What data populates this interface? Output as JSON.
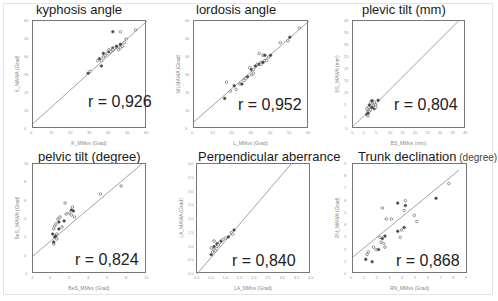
{
  "figure": {
    "panels": [
      {
        "title": "kyphosis angle",
        "title_suffix": "",
        "r_label": "r = 0,926",
        "xlabel": "K_MMvs (Grad)",
        "ylabel": "K_MAWA (Grad)",
        "xticks": [
          "0",
          "10",
          "20",
          "30",
          "40",
          "50",
          "60"
        ],
        "yticks": [
          "0",
          "10",
          "20",
          "30",
          "40",
          "50",
          "60"
        ]
      },
      {
        "title": "lordosis angle",
        "title_suffix": "",
        "r_label": "r = 0,952",
        "xlabel": "L_MMvs (Grad)",
        "ylabel": "WLMAWA (Grad)",
        "xticks": [
          "0",
          "10",
          "20",
          "30",
          "40",
          "50",
          "60"
        ],
        "yticks": [
          "0",
          "10",
          "20",
          "30",
          "40",
          "50",
          "60"
        ]
      },
      {
        "title": "plevic tilt (mm)",
        "title_suffix": "",
        "r_label": "r = 0,804",
        "xlabel": "BS_MMvs (mm)",
        "ylabel": "BS_MAWA (mm)",
        "xticks": [
          "-5",
          "0",
          "5",
          "10",
          "15",
          "20",
          "25",
          "30",
          "35",
          "40"
        ],
        "yticks": [
          "-5",
          "0",
          "5",
          "10",
          "15",
          "20",
          "25",
          "30",
          "35",
          "40"
        ]
      },
      {
        "title": "pelvic tilt (degree)",
        "title_suffix": "",
        "r_label": "r = 0,824",
        "xlabel": "BeS_MMvs (Grad)",
        "ylabel": "BeS_MAWA (Grad)",
        "xticks": [
          "-1",
          "0",
          "2",
          "4",
          "6",
          "8",
          "10"
        ],
        "yticks": [
          "-1",
          "0",
          "2",
          "4",
          "6",
          "8",
          "10"
        ]
      },
      {
        "title": "Perpendicular aberrance",
        "title_suffix": "",
        "r_label": "r = 0,840",
        "xlabel": "LA_MMvs (Grad)",
        "ylabel": "LA_MAWA (Grad)",
        "xticks": [
          "0,0",
          "0,5",
          "1,0",
          "1,5",
          "2,0",
          "2,5",
          "3,0",
          "3,5",
          "4,0"
        ],
        "yticks": [
          "0,0",
          "0,5",
          "1,0",
          "1,5",
          "2,0",
          "2,5",
          "3,0",
          "3,5",
          "4,0"
        ]
      },
      {
        "title": "Trunk declination",
        "title_suffix": "(degree)",
        "r_label": "r = 0,868",
        "xlabel": "RN_MMvs (Grad)",
        "ylabel": "RN_MAWA (Grad)",
        "xticks": [
          "0",
          "1",
          "2",
          "3",
          "4",
          "5",
          "6",
          "7",
          "8",
          "9"
        ],
        "yticks": [
          "0",
          "1",
          "2",
          "3",
          "4",
          "5",
          "6",
          "7",
          "8",
          "9"
        ]
      }
    ]
  },
  "chart_data": [
    {
      "type": "scatter",
      "title": "kyphosis angle",
      "xlabel": "K_MMvs (Grad)",
      "ylabel": "K_MAWA (Grad)",
      "xlim": [
        0,
        60
      ],
      "ylim": [
        0,
        60
      ],
      "grid": false,
      "annotation": "r = 0,926",
      "regression_line": {
        "x": [
          0,
          60
        ],
        "y": [
          3,
          60
        ]
      },
      "x": [
        29,
        30,
        34,
        35,
        36,
        37,
        37,
        38,
        39,
        40,
        40,
        41,
        42,
        42,
        43,
        44,
        45,
        46,
        46,
        47,
        48,
        42,
        46,
        54,
        36,
        49
      ],
      "y": [
        31,
        32,
        38,
        39,
        38,
        40,
        42,
        41,
        42,
        43,
        44,
        43,
        45,
        44,
        45,
        46,
        44,
        45,
        47,
        46,
        48,
        54,
        54,
        55,
        35,
        50
      ]
    },
    {
      "type": "scatter",
      "title": "lordosis angle",
      "xlabel": "L_MMvs (Grad)",
      "ylabel": "WLMAWA (Grad)",
      "xlim": [
        0,
        60
      ],
      "ylim": [
        0,
        60
      ],
      "grid": false,
      "annotation": "r = 0,952",
      "regression_line": {
        "x": [
          0,
          60
        ],
        "y": [
          4,
          60
        ]
      },
      "x": [
        16,
        17,
        19,
        21,
        22,
        24,
        25,
        26,
        27,
        28,
        29,
        30,
        30,
        31,
        31,
        32,
        33,
        34,
        34,
        35,
        35,
        36,
        36,
        37,
        37,
        38,
        39,
        40,
        45,
        49,
        50,
        55
      ],
      "y": [
        17,
        26,
        21,
        24,
        22,
        25,
        25,
        27,
        28,
        29,
        34,
        30,
        33,
        31,
        33,
        35,
        36,
        42,
        36,
        37,
        36,
        37,
        41,
        38,
        41,
        38,
        40,
        41,
        48,
        49,
        51,
        56
      ]
    },
    {
      "type": "scatter",
      "title": "plevic tilt (mm)",
      "xlabel": "BS_MMvs (mm)",
      "ylabel": "BS_MAWA (mm)",
      "xlim": [
        -5,
        40
      ],
      "ylim": [
        -5,
        40
      ],
      "grid": false,
      "annotation": "r = 0,804",
      "regression_line": {
        "x": [
          -5,
          37
        ],
        "y": [
          -4,
          40
        ]
      },
      "x": [
        0.5,
        0.8,
        1,
        1,
        1.2,
        1.5,
        1.5,
        2,
        2,
        2.5,
        3,
        3,
        3.5,
        4,
        4,
        5,
        1,
        0.5,
        2.5,
        3.5
      ],
      "y": [
        1,
        2,
        3,
        1.5,
        4,
        2.5,
        5,
        3,
        6,
        4,
        5,
        6.5,
        3.5,
        5,
        4,
        7,
        0.5,
        3.5,
        6.8,
        6.2
      ]
    },
    {
      "type": "scatter",
      "title": "pelvic tilt (degree)",
      "xlabel": "BeS_MMvs (Grad)",
      "ylabel": "BeS_MAWA (Grad)",
      "xlim": [
        -1,
        10
      ],
      "ylim": [
        -1,
        10
      ],
      "grid": false,
      "annotation": "r = 0,824",
      "regression_line": {
        "x": [
          -1,
          9.5
        ],
        "y": [
          0.8,
          10
        ]
      },
      "x": [
        0.9,
        1.0,
        1.0,
        1.1,
        1.1,
        1.2,
        1.2,
        1.3,
        1.4,
        1.5,
        1.6,
        1.8,
        2.0,
        2.2,
        2.5,
        2.7,
        2.7,
        2.8,
        2.9,
        3.0,
        1.3,
        1.0,
        5.5,
        7.5,
        1.5,
        2.1
      ],
      "y": [
        3.0,
        2.0,
        3.5,
        2.7,
        3.8,
        4.0,
        2.8,
        3.0,
        4.5,
        3.5,
        4.7,
        3.7,
        4.3,
        5.0,
        5.1,
        5.4,
        4.9,
        5.7,
        5.3,
        4.7,
        2.5,
        2.2,
        7.0,
        7.8,
        4.2,
        6.1
      ]
    },
    {
      "type": "scatter",
      "title": "Perpendicular aberrance",
      "xlabel": "LA_MMvs (Grad)",
      "ylabel": "LA_MAWA (Grad)",
      "xlim": [
        0,
        4
      ],
      "ylim": [
        0,
        4
      ],
      "grid": false,
      "annotation": "r = 0,840",
      "regression_line": {
        "x": [
          0,
          3.3
        ],
        "y": [
          0,
          4
        ]
      },
      "x": [
        0.5,
        0.55,
        0.6,
        0.6,
        0.65,
        0.7,
        0.7,
        0.75,
        0.8,
        0.85,
        0.9,
        1.0,
        1.1,
        1.2,
        1.25,
        1.3,
        0.6,
        0.5
      ],
      "y": [
        0.7,
        0.8,
        0.9,
        1.0,
        0.85,
        1.0,
        1.1,
        1.05,
        1.15,
        1.2,
        1.25,
        1.3,
        1.35,
        1.5,
        1.45,
        1.6,
        1.2,
        0.95
      ]
    },
    {
      "type": "scatter",
      "title": "Trunk declination (degree)",
      "xlabel": "RN_MMvs (Grad)",
      "ylabel": "RN_MAWA (Grad)",
      "xlim": [
        0,
        9
      ],
      "ylim": [
        0,
        9
      ],
      "grid": false,
      "annotation": "r = 0,868",
      "regression_line": {
        "x": [
          0,
          8.3
        ],
        "y": [
          1.4,
          8.5
        ]
      },
      "x": [
        1.0,
        1.1,
        1.2,
        1.5,
        1.6,
        1.8,
        2.0,
        2.1,
        2.2,
        2.3,
        2.4,
        2.5,
        2.5,
        2.6,
        3.0,
        3.5,
        3.7,
        3.8,
        4.0,
        4.0,
        4.1,
        4.1,
        4.8,
        5.0,
        6.5,
        7.5,
        2.3,
        3.5
      ],
      "y": [
        1.2,
        1.6,
        1.8,
        1.0,
        2.2,
        2.0,
        2.0,
        3.0,
        2.6,
        2.9,
        2.5,
        2.2,
        3.1,
        4.5,
        4.5,
        3.5,
        3.0,
        3.6,
        3.8,
        5.2,
        6.0,
        5.6,
        4.8,
        4.3,
        6.2,
        7.4,
        5.4,
        5.8
      ]
    }
  ]
}
